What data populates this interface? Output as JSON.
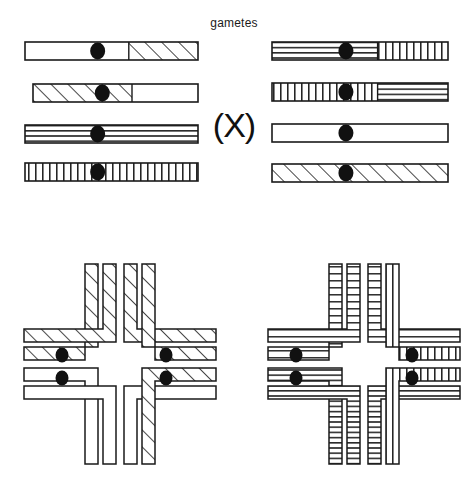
{
  "figure": {
    "title": "gametes",
    "cross_symbol": "(X)",
    "width": 468,
    "height": 487,
    "background_color": "#ffffff",
    "outline_color": "#1a1a1a",
    "centromere_color": "#111111",
    "patterns": {
      "plain": "white / unshaded",
      "diagonal": "diagonal-hatch",
      "horizontal": "horizontal-lines",
      "vertical": "vertical-lines"
    }
  },
  "gametes_panel": {
    "label": "gametes",
    "left_group": {
      "name": "parent-1-gametes",
      "chromosomes": [
        {
          "index": 1,
          "x": 25,
          "y": 42,
          "width": 173,
          "height": 18,
          "segments": [
            {
              "pattern": "plain",
              "fraction": 0.6
            },
            {
              "pattern": "diagonal",
              "fraction": 0.4
            }
          ],
          "centromere_position": 0.42
        },
        {
          "index": 2,
          "x": 33,
          "y": 84,
          "width": 165,
          "height": 18,
          "segments": [
            {
              "pattern": "diagonal",
              "fraction": 0.6
            },
            {
              "pattern": "plain",
              "fraction": 0.4
            }
          ],
          "centromere_position": 0.42
        },
        {
          "index": 3,
          "x": 25,
          "y": 125,
          "width": 173,
          "height": 18,
          "segments": [
            {
              "pattern": "horizontal",
              "fraction": 1.0
            }
          ],
          "centromere_position": 0.42
        },
        {
          "index": 4,
          "x": 25,
          "y": 163,
          "width": 173,
          "height": 18,
          "segments": [
            {
              "pattern": "vertical",
              "fraction": 1.0
            }
          ],
          "centromere_position": 0.42
        }
      ]
    },
    "right_group": {
      "name": "parent-2-gametes",
      "chromosomes": [
        {
          "index": 1,
          "x": 272,
          "y": 42,
          "width": 176,
          "height": 18,
          "segments": [
            {
              "pattern": "horizontal",
              "fraction": 0.6
            },
            {
              "pattern": "vertical",
              "fraction": 0.4
            }
          ],
          "centromere_position": 0.42
        },
        {
          "index": 2,
          "x": 272,
          "y": 83,
          "width": 176,
          "height": 18,
          "segments": [
            {
              "pattern": "vertical",
              "fraction": 0.6
            },
            {
              "pattern": "horizontal",
              "fraction": 0.4
            }
          ],
          "centromere_position": 0.42
        },
        {
          "index": 3,
          "x": 272,
          "y": 124,
          "width": 176,
          "height": 18,
          "segments": [
            {
              "pattern": "plain",
              "fraction": 1.0
            }
          ],
          "centromere_position": 0.42
        },
        {
          "index": 4,
          "x": 272,
          "y": 164,
          "width": 176,
          "height": 18,
          "segments": [
            {
              "pattern": "diagonal",
              "fraction": 1.0
            }
          ],
          "centromere_position": 0.42
        }
      ]
    }
  },
  "bivalents_panel": {
    "left_bivalent": {
      "name": "bivalent-left",
      "center_x": 120,
      "center_y": 364,
      "arms": {
        "top_left": {
          "pattern": "diagonal"
        },
        "top_right": {
          "pattern": "diagonal"
        },
        "right_upper": {
          "pattern": "diagonal"
        },
        "right_lower": {
          "pattern": "diagonal"
        },
        "left_upper": {
          "pattern": "plain"
        },
        "left_lower": {
          "pattern": "plain"
        },
        "bottom_left": {
          "pattern": "plain"
        },
        "bottom_right": {
          "pattern": "plain"
        }
      },
      "centromeres": [
        {
          "x": 62,
          "y": 355
        },
        {
          "x": 62,
          "y": 378
        },
        {
          "x": 166,
          "y": 355
        },
        {
          "x": 166,
          "y": 378
        }
      ]
    },
    "right_bivalent": {
      "name": "bivalent-right",
      "center_x": 364,
      "center_y": 364,
      "arms": {
        "top_left": {
          "pattern": "vertical"
        },
        "top_right": {
          "pattern": "vertical"
        },
        "right_upper": {
          "pattern": "vertical"
        },
        "right_lower": {
          "pattern": "vertical"
        },
        "left_upper": {
          "pattern": "horizontal"
        },
        "left_lower": {
          "pattern": "horizontal"
        },
        "bottom_left": {
          "pattern": "horizontal"
        },
        "bottom_right": {
          "pattern": "horizontal"
        }
      },
      "centromeres": [
        {
          "x": 296,
          "y": 355
        },
        {
          "x": 296,
          "y": 378
        },
        {
          "x": 412,
          "y": 355
        },
        {
          "x": 412,
          "y": 378
        }
      ]
    }
  }
}
